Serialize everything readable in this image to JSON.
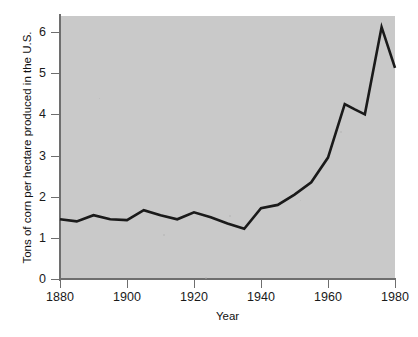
{
  "chart_data": {
    "type": "line",
    "title": "",
    "subtitle": "",
    "xlabel": "Year",
    "ylabel": "Tons of corn per hectare produced in the U.S.",
    "xlim": [
      1880,
      1980
    ],
    "ylim": [
      0,
      6.4
    ],
    "xticks": [
      1880,
      1900,
      1920,
      1940,
      1960,
      1980
    ],
    "xtick_labels": [
      "1880",
      "1900",
      "1920",
      "1940",
      "1960",
      "1980"
    ],
    "yticks": [
      0,
      1,
      2,
      3,
      4,
      5,
      6
    ],
    "ytick_labels": [
      "0",
      "1",
      "2",
      "3",
      "4",
      "5",
      "6"
    ],
    "grid": false,
    "legend": false,
    "legend_position": "none",
    "line_color": "#1a1a1a",
    "line_width": 2.6,
    "plot_background": "#c9c9c9",
    "figure_background": "#ffffff",
    "series": [
      {
        "name": "Tons of corn per hectare produced in the U.S.",
        "x": [
          1880,
          1885,
          1890,
          1895,
          1900,
          1905,
          1910,
          1915,
          1920,
          1925,
          1930,
          1935,
          1940,
          1945,
          1950,
          1955,
          1960,
          1965,
          1968,
          1971,
          1976,
          1980
        ],
        "values": [
          1.45,
          1.4,
          1.55,
          1.45,
          1.43,
          1.67,
          1.55,
          1.45,
          1.62,
          1.5,
          1.35,
          1.22,
          1.72,
          1.8,
          2.05,
          2.35,
          2.95,
          4.25,
          4.12,
          4.0,
          6.12,
          5.13
        ]
      }
    ],
    "annotations": []
  },
  "axes": {
    "y_title": "Tons of corn per hectare produced in the U.S.",
    "x_title": "Year"
  }
}
